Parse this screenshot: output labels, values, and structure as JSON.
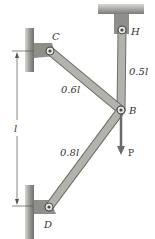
{
  "diagram": {
    "type": "truss-mechanism",
    "points": {
      "C": {
        "label": "C"
      },
      "B": {
        "label": "B"
      },
      "H": {
        "label": "H"
      },
      "D": {
        "label": "D"
      }
    },
    "members": [
      {
        "from": "C",
        "to": "B",
        "length_label": "0.6l"
      },
      {
        "from": "H",
        "to": "B",
        "length_label": "0.5l"
      },
      {
        "from": "D",
        "to": "B",
        "length_label": "0.8l"
      }
    ],
    "load": {
      "at": "B",
      "label": "P",
      "direction": "down"
    },
    "dimension": {
      "label": "l",
      "between": [
        "C",
        "D"
      ],
      "orientation": "vertical"
    },
    "colors": {
      "member": "#a9a9a3",
      "member_edge": "#6f6f69",
      "wall": "#8a8a86",
      "bracket": "#7a7a76",
      "load_arrow": "#6a6a6a"
    }
  }
}
